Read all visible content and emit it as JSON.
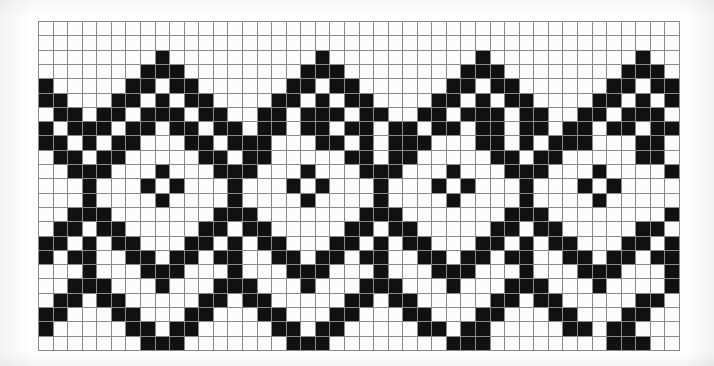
{
  "document": {
    "kind": "pattern-chart",
    "title": "Knitting / cross-stitch chart — repeating zigzag diamond border",
    "description": "Monochrome grid chart of a Fair-Isle style repeating chevron-and-diamond motif"
  },
  "colors": {
    "background": "#ffffff",
    "grid_line": "#8a8a8a",
    "cell_empty": "#fcfcfc",
    "cell_filled": "#111111"
  },
  "chart_data": {
    "type": "heatmap",
    "xlabel": "",
    "ylabel": "",
    "columns": 44,
    "rows": 23,
    "repeat_width": 11,
    "repeat_count": 4,
    "legend": [
      {
        "label": "filled stitch",
        "value": 1,
        "color": "#111111"
      },
      {
        "label": "empty stitch",
        "value": 0,
        "color": "#fcfcfc"
      }
    ],
    "grid": true,
    "values": [
      [
        0,
        0,
        0,
        0,
        0,
        0,
        0,
        0,
        0,
        0,
        0,
        0,
        0,
        0,
        0,
        0,
        0,
        0,
        0,
        0,
        0,
        0,
        0,
        0,
        0,
        0,
        0,
        0,
        0,
        0,
        0,
        0,
        0,
        0,
        0,
        0,
        0,
        0,
        0,
        0,
        0,
        0,
        0,
        0
      ],
      [
        0,
        0,
        0,
        0,
        0,
        0,
        0,
        0,
        0,
        0,
        0,
        0,
        0,
        0,
        0,
        0,
        0,
        0,
        0,
        0,
        0,
        0,
        0,
        0,
        0,
        0,
        0,
        0,
        0,
        0,
        0,
        0,
        0,
        0,
        0,
        0,
        0,
        0,
        0,
        0,
        0,
        0,
        0,
        0
      ],
      [
        0,
        0,
        0,
        0,
        0,
        0,
        0,
        0,
        1,
        0,
        0,
        0,
        0,
        0,
        0,
        0,
        0,
        0,
        0,
        1,
        0,
        0,
        0,
        0,
        0,
        0,
        0,
        0,
        0,
        0,
        1,
        0,
        0,
        0,
        0,
        0,
        0,
        0,
        0,
        0,
        0,
        1,
        0,
        0
      ],
      [
        0,
        0,
        0,
        0,
        0,
        0,
        0,
        1,
        1,
        1,
        0,
        0,
        0,
        0,
        0,
        0,
        0,
        0,
        1,
        1,
        1,
        0,
        0,
        0,
        0,
        0,
        0,
        0,
        0,
        1,
        1,
        1,
        0,
        0,
        0,
        0,
        0,
        0,
        0,
        0,
        1,
        1,
        1,
        0
      ],
      [
        1,
        0,
        0,
        0,
        0,
        0,
        1,
        1,
        0,
        1,
        1,
        0,
        0,
        0,
        0,
        0,
        0,
        1,
        1,
        0,
        1,
        1,
        0,
        0,
        0,
        0,
        0,
        0,
        1,
        1,
        0,
        1,
        1,
        0,
        0,
        0,
        0,
        0,
        0,
        1,
        1,
        0,
        1,
        1
      ],
      [
        1,
        1,
        0,
        0,
        0,
        1,
        1,
        0,
        1,
        0,
        1,
        1,
        0,
        0,
        0,
        0,
        1,
        1,
        0,
        1,
        0,
        1,
        1,
        0,
        0,
        0,
        0,
        1,
        1,
        0,
        1,
        0,
        1,
        1,
        0,
        0,
        0,
        0,
        1,
        1,
        0,
        1,
        0,
        1
      ],
      [
        0,
        1,
        1,
        0,
        1,
        1,
        0,
        1,
        1,
        1,
        0,
        1,
        1,
        0,
        0,
        1,
        1,
        0,
        1,
        1,
        1,
        0,
        1,
        1,
        0,
        0,
        1,
        1,
        0,
        1,
        1,
        1,
        0,
        1,
        1,
        0,
        0,
        1,
        1,
        0,
        1,
        1,
        1,
        0
      ],
      [
        1,
        0,
        1,
        1,
        1,
        0,
        1,
        1,
        0,
        1,
        1,
        0,
        1,
        1,
        0,
        1,
        1,
        0,
        1,
        1,
        0,
        1,
        1,
        0,
        1,
        1,
        0,
        1,
        1,
        0,
        1,
        1,
        0,
        1,
        1,
        0,
        1,
        1,
        0,
        1,
        1,
        0,
        1,
        1
      ],
      [
        1,
        1,
        0,
        1,
        0,
        1,
        1,
        0,
        0,
        0,
        1,
        1,
        0,
        1,
        1,
        1,
        0,
        0,
        0,
        1,
        1,
        0,
        1,
        0,
        1,
        1,
        1,
        0,
        0,
        0,
        1,
        1,
        0,
        1,
        0,
        1,
        1,
        1,
        0,
        0,
        0,
        1,
        1,
        0
      ],
      [
        0,
        1,
        1,
        0,
        1,
        1,
        0,
        0,
        0,
        0,
        0,
        1,
        1,
        0,
        1,
        1,
        0,
        0,
        0,
        0,
        0,
        1,
        1,
        0,
        1,
        1,
        0,
        0,
        0,
        0,
        0,
        1,
        1,
        0,
        1,
        1,
        0,
        0,
        0,
        0,
        0,
        1,
        1,
        0
      ],
      [
        0,
        0,
        1,
        1,
        1,
        0,
        0,
        0,
        1,
        0,
        0,
        0,
        1,
        1,
        1,
        0,
        0,
        0,
        1,
        0,
        0,
        0,
        1,
        1,
        1,
        0,
        0,
        0,
        1,
        0,
        0,
        0,
        1,
        1,
        1,
        0,
        0,
        0,
        1,
        0,
        0,
        0,
        0,
        1
      ],
      [
        0,
        0,
        0,
        1,
        0,
        0,
        0,
        1,
        0,
        1,
        0,
        0,
        0,
        1,
        0,
        0,
        0,
        1,
        0,
        1,
        0,
        0,
        0,
        1,
        0,
        0,
        0,
        1,
        0,
        1,
        0,
        0,
        0,
        1,
        0,
        0,
        0,
        1,
        0,
        1,
        0,
        0,
        0,
        0
      ],
      [
        0,
        0,
        0,
        1,
        0,
        0,
        0,
        0,
        1,
        0,
        0,
        0,
        0,
        1,
        0,
        0,
        0,
        0,
        1,
        0,
        0,
        0,
        0,
        1,
        0,
        0,
        0,
        0,
        1,
        0,
        0,
        0,
        0,
        1,
        0,
        0,
        0,
        0,
        1,
        0,
        0,
        0,
        0,
        0
      ],
      [
        0,
        0,
        1,
        1,
        1,
        0,
        0,
        0,
        0,
        0,
        0,
        0,
        1,
        1,
        1,
        0,
        0,
        0,
        0,
        0,
        0,
        0,
        1,
        1,
        1,
        0,
        0,
        0,
        0,
        0,
        0,
        0,
        1,
        1,
        1,
        0,
        0,
        0,
        0,
        0,
        0,
        0,
        0,
        1
      ],
      [
        0,
        1,
        1,
        0,
        1,
        1,
        0,
        0,
        0,
        0,
        0,
        1,
        1,
        0,
        1,
        1,
        0,
        0,
        0,
        0,
        0,
        1,
        1,
        0,
        1,
        1,
        0,
        0,
        0,
        0,
        0,
        1,
        1,
        0,
        1,
        1,
        0,
        0,
        0,
        0,
        0,
        1,
        1,
        0
      ],
      [
        1,
        1,
        0,
        1,
        0,
        1,
        1,
        0,
        0,
        0,
        1,
        1,
        0,
        1,
        0,
        1,
        1,
        0,
        0,
        0,
        1,
        1,
        0,
        1,
        0,
        1,
        1,
        0,
        0,
        0,
        1,
        1,
        0,
        1,
        0,
        1,
        1,
        0,
        0,
        0,
        1,
        1,
        0,
        1
      ],
      [
        1,
        0,
        1,
        1,
        0,
        0,
        1,
        1,
        0,
        1,
        1,
        0,
        1,
        1,
        0,
        0,
        1,
        1,
        0,
        1,
        1,
        0,
        1,
        1,
        0,
        0,
        1,
        1,
        0,
        1,
        1,
        0,
        1,
        1,
        0,
        0,
        1,
        1,
        0,
        1,
        1,
        0,
        1,
        1
      ],
      [
        0,
        0,
        0,
        1,
        0,
        0,
        0,
        1,
        1,
        1,
        0,
        0,
        0,
        1,
        0,
        0,
        0,
        1,
        1,
        1,
        0,
        0,
        0,
        1,
        0,
        0,
        0,
        1,
        1,
        1,
        0,
        0,
        0,
        1,
        0,
        0,
        0,
        1,
        1,
        1,
        0,
        0,
        0,
        1
      ],
      [
        0,
        0,
        1,
        1,
        1,
        0,
        0,
        0,
        1,
        0,
        0,
        0,
        1,
        1,
        1,
        0,
        0,
        0,
        1,
        0,
        0,
        0,
        1,
        1,
        1,
        0,
        0,
        0,
        1,
        0,
        0,
        0,
        1,
        1,
        1,
        0,
        0,
        0,
        1,
        0,
        0,
        0,
        0,
        1
      ],
      [
        0,
        1,
        1,
        0,
        1,
        1,
        0,
        0,
        0,
        0,
        0,
        1,
        1,
        0,
        1,
        1,
        0,
        0,
        0,
        0,
        0,
        1,
        1,
        0,
        1,
        1,
        0,
        0,
        0,
        0,
        0,
        1,
        1,
        0,
        1,
        1,
        0,
        0,
        0,
        0,
        0,
        1,
        1,
        0
      ],
      [
        1,
        1,
        0,
        0,
        0,
        1,
        1,
        0,
        0,
        0,
        1,
        1,
        0,
        0,
        0,
        1,
        1,
        0,
        0,
        0,
        1,
        1,
        0,
        0,
        0,
        1,
        1,
        0,
        0,
        0,
        1,
        1,
        0,
        0,
        0,
        1,
        1,
        0,
        0,
        0,
        1,
        1,
        0,
        0
      ],
      [
        1,
        0,
        0,
        0,
        0,
        0,
        1,
        1,
        0,
        1,
        1,
        0,
        0,
        0,
        0,
        0,
        1,
        1,
        0,
        1,
        1,
        0,
        0,
        0,
        0,
        0,
        1,
        1,
        0,
        1,
        1,
        0,
        0,
        0,
        0,
        0,
        1,
        1,
        0,
        1,
        1,
        0,
        0,
        0
      ],
      [
        0,
        0,
        0,
        0,
        0,
        0,
        0,
        1,
        1,
        1,
        0,
        0,
        0,
        0,
        0,
        0,
        0,
        1,
        1,
        1,
        0,
        0,
        0,
        0,
        0,
        0,
        0,
        0,
        1,
        1,
        1,
        0,
        0,
        0,
        0,
        0,
        0,
        0,
        0,
        1,
        1,
        1,
        0,
        0
      ]
    ]
  }
}
